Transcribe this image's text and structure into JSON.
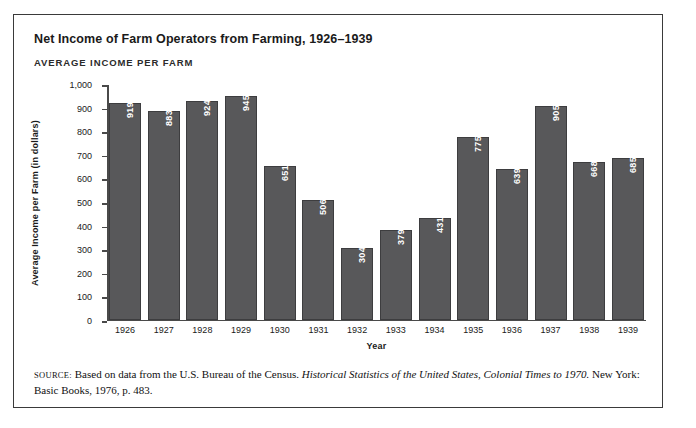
{
  "figure": {
    "title": "Net Income of Farm Operators from Farming, 1926–1939",
    "subtitle": "AVERAGE INCOME PER FARM",
    "frame_color": "#3a3a3a",
    "bar_color": "#58585a",
    "bar_outline_color": "#3d3d3f",
    "value_label_color": "#ffffff"
  },
  "source": {
    "label": "Source:",
    "text_before": "Based on data from the U.S. Bureau of the Census.",
    "work_title": "Historical Statistics of the United States, Colonial Times to 1970.",
    "text_after": "New York: Basic Books, 1976, p. 483."
  },
  "chart_data": {
    "type": "bar",
    "title": "Net Income of Farm Operators from Farming, 1926–1939",
    "subtitle": "AVERAGE INCOME PER FARM",
    "xlabel": "Year",
    "ylabel": "Average Income per Farm (in dollars)",
    "categories": [
      "1926",
      "1927",
      "1928",
      "1929",
      "1930",
      "1931",
      "1932",
      "1933",
      "1934",
      "1935",
      "1936",
      "1937",
      "1938",
      "1939"
    ],
    "values": [
      919,
      883,
      924,
      945,
      651,
      506,
      304,
      379,
      431,
      775,
      639,
      905,
      668,
      685
    ],
    "value_labels": [
      "919",
      "883",
      "924",
      "945",
      "651",
      "506",
      "304",
      "379",
      "431",
      "775",
      "639",
      "905",
      "668",
      "685"
    ],
    "ylim": [
      0,
      1000
    ],
    "ytick_values": [
      0,
      100,
      200,
      300,
      400,
      500,
      600,
      700,
      800,
      900,
      1000
    ],
    "ytick_labels": [
      "0",
      "100",
      "200",
      "300",
      "400",
      "500",
      "600",
      "700",
      "800",
      "900",
      "1,000"
    ],
    "grid": false,
    "legend": false
  }
}
